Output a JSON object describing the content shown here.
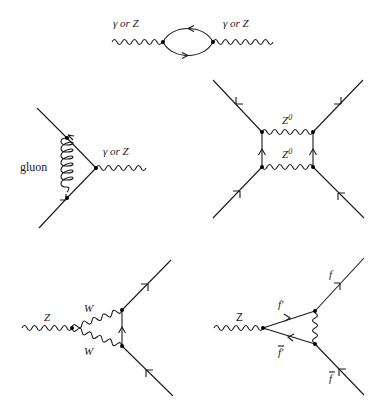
{
  "diagrams": [
    {
      "id": "vacuum-polarization",
      "labels": {
        "left_boson": "γ or Z",
        "right_boson": "γ or Z"
      }
    },
    {
      "id": "gluon-vertex-correction",
      "labels": {
        "gluon": "gluon",
        "boson": "γ or Z"
      }
    },
    {
      "id": "z0-box",
      "labels": {
        "top_boson": "Z",
        "top_boson_sup": "0",
        "bottom_boson": "Z",
        "bottom_boson_sup": "0"
      }
    },
    {
      "id": "w-triangle",
      "labels": {
        "incoming": "Z",
        "top_w": "W",
        "bottom_w": "W"
      }
    },
    {
      "id": "fermion-triangle",
      "labels": {
        "incoming": "Z",
        "top_inner": "f′",
        "bottom_inner": "f′",
        "top_out": "f",
        "bottom_out": "f"
      }
    }
  ]
}
